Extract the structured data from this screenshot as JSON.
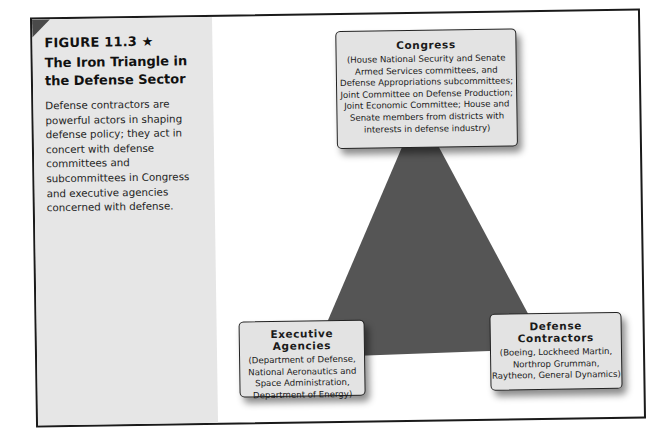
{
  "figure": {
    "label": "FIGURE 11.3 ★",
    "title": "The Iron Triangle in the Defense Sector",
    "caption": "Defense contractors are powerful actors in shaping defense policy; they act in concert with defense committees and subcommittees in Congress and executive agencies concerned with defense."
  },
  "diagram": {
    "type": "iron-triangle",
    "triangle_color": "#555555",
    "nodes": [
      {
        "id": "congress",
        "title": "Congress",
        "description": "(House National Security and Senate Armed Services committees, and Defense Appropriations subcommittees; Joint Committee on Defense Production; Joint Economic Committee; House and Senate members from districts with interests in defense industry)"
      },
      {
        "id": "executive",
        "title": "Executive Agencies",
        "description": "(Department of Defense, National Aeronautics and Space Administration, Department of Energy)"
      },
      {
        "id": "contractors",
        "title": "Defense Contractors",
        "description": "(Boeing, Lockheed Martin, Northrop Grumman, Raytheon, General Dynamics)"
      }
    ]
  }
}
